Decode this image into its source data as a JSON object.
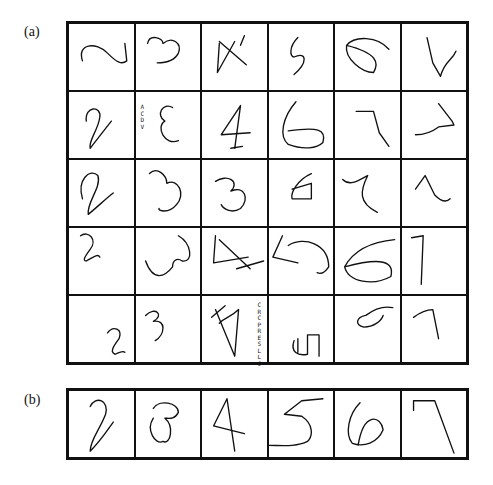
{
  "figure": {
    "panel_a": {
      "label": "(a)",
      "rows": 5,
      "cols": 6,
      "cells": [
        {
          "digit": "2",
          "path": "M14 38 C8 20 28 18 40 30 C50 40 55 42 60 38 L58 20"
        },
        {
          "digit": "3",
          "path": "M12 20 C14 10 28 14 28 20 C38 12 48 20 44 30 C40 38 30 40 22 40"
        },
        {
          "digit": "4",
          "path": "M18 20 L16 50 L34 18 M18 18 L46 42 M44 12 L40 22"
        },
        {
          "digit": "5",
          "path": "M30 14 C20 24 22 34 26 34 C40 28 40 40 26 52"
        },
        {
          "digit": "6",
          "path": "M56 26 C44 12 20 12 12 22 C10 36 28 50 40 50 C46 40 44 30 12 22"
        },
        {
          "digit": "7",
          "path": "M26 14 L32 40 L40 54 C44 38 52 38 56 28"
        },
        {
          "digit": "2",
          "path": "M18 30 C16 14 34 14 32 26 C30 40 20 50 22 58 C30 48 36 40 44 30"
        },
        {
          "digit": "3",
          "path": "M38 16 C28 10 20 24 30 30 C20 36 30 56 44 50",
          "tiny": "ACDV"
        },
        {
          "digit": "4",
          "path": "M40 14 L20 44 L50 42 M40 14 L34 58 M30 58 L42 56"
        },
        {
          "digit": "6",
          "path": "M28 10 C14 26 10 46 20 54 C36 60 50 58 56 52 C60 38 50 36 20 40"
        },
        {
          "digit": "7",
          "path": "M22 20 L40 20 L46 42 L56 56"
        },
        {
          "digit": "7",
          "path": "M38 12 L52 30 L54 34 L38 36 C30 42 22 44 14 44"
        },
        {
          "digit": "2",
          "path": "M14 40 C8 20 22 8 30 16 C34 28 18 44 20 56 C30 48 38 40 46 34"
        },
        {
          "digit": "3",
          "path": "M14 14 C22 6 32 16 32 24 C44 18 52 36 42 46 C34 56 22 52 24 50"
        },
        {
          "digit": "3",
          "path": "M14 22 C26 14 40 22 30 32 C44 26 50 40 40 50 C30 56 22 50 20 46"
        },
        {
          "digit": "6",
          "path": "M44 14 C30 20 22 34 24 40 L44 40 L44 24 L24 30"
        },
        {
          "digit": "7",
          "path": "M8 20 C16 28 26 20 34 16 C26 32 24 44 44 54"
        },
        {
          "digit": "1",
          "path": "M14 30 L24 16 L34 36 C40 42 46 44 50 40"
        },
        {
          "digit": "2",
          "path": "M12 8 C20 2 30 12 22 22 C16 30 14 34 18 34 C26 30 30 26 32 30"
        },
        {
          "digit": "3",
          "path": "M44 8 C58 16 60 36 48 34 C42 30 38 34 38 40 C30 50 18 56 10 34"
        },
        {
          "digit": "4",
          "path": "M14 8 L12 36 L48 30 M18 12 L50 42 M36 42 L64 34"
        },
        {
          "digit": "5",
          "path": "M14 8 L4 30 L30 36 M20 18 C36 8 62 16 62 40 C58 46 54 48 50 46"
        },
        {
          "digit": "6",
          "path": "M62 12 C40 14 20 22 10 40 C14 56 40 60 58 50 C62 34 48 30 10 40"
        },
        {
          "digit": "7",
          "path": "M10 10 L22 8 L20 58"
        },
        {
          "digit": "2",
          "path": "M40 38 C46 30 56 34 52 44 C46 52 42 58 48 60 C52 58 56 56 58 58"
        },
        {
          "digit": "3",
          "path": "M10 20 C20 10 30 20 18 26 C32 24 30 40 20 46"
        },
        {
          "digit": "4",
          "path": "M10 22 L24 10 M14 14 L34 62 L38 14 C30 22 24 22 18 28",
          "tiny": "CRCPRESLLC"
        },
        {
          "digit": "5",
          "path": "M26 46 C22 58 30 62 40 60 L40 40 L52 40 L52 62 M30 44 L30 58"
        },
        {
          "digit": "6",
          "path": "M60 12 C50 10 40 14 32 20 C22 22 20 30 30 32 C40 32 48 26 50 20"
        },
        {
          "digit": "7",
          "path": "M12 22 C20 16 28 14 32 14 L38 44"
        }
      ]
    },
    "panel_b": {
      "label": "(b)",
      "rows": 1,
      "cols": 6,
      "cells": [
        {
          "digit": "2",
          "path": "M22 16 C28 4 42 10 38 24 C32 40 22 50 22 62 C34 50 40 40 46 32"
        },
        {
          "digit": "3",
          "path": "M18 18 C24 8 44 12 44 22 C40 30 34 28 30 28 C40 36 36 56 28 52 C20 56 10 40 18 28"
        },
        {
          "digit": "4",
          "path": "M26 8 L12 36 L44 44 M26 8 L34 62"
        },
        {
          "digit": "5",
          "path": "M56 8 L34 10 L16 24 L34 26 C46 34 46 46 40 52 C28 58 12 56 0 56"
        },
        {
          "digit": "6",
          "path": "M26 12 C14 24 10 44 18 54 C30 58 44 54 50 40 C48 26 30 20 24 56"
        },
        {
          "digit": "7",
          "path": "M12 10 L12 20 M12 10 L34 10 L54 64"
        }
      ]
    }
  }
}
